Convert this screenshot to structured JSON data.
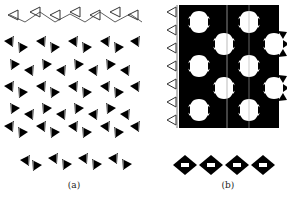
{
  "figure": {
    "panels": [
      {
        "id": "a",
        "caption": "(a)",
        "description": "layered tetrahedral chains (side view) with single chain below"
      },
      {
        "id": "b",
        "caption": "(b)",
        "description": "framework of tetrahedral rings with single chain below"
      }
    ],
    "colors": {
      "filled": "#000000",
      "outline": "#333333",
      "background": "#ffffff"
    }
  }
}
